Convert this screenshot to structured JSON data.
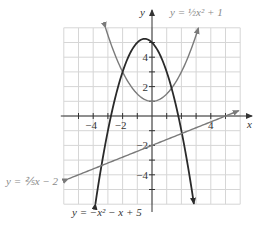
{
  "chart_data": {
    "type": "line",
    "title": "",
    "xlabel": "x",
    "ylabel": "y",
    "xlim": [
      -6,
      6
    ],
    "ylim": [
      -6,
      6
    ],
    "grid": true,
    "x_ticks": [
      -4,
      -2,
      4
    ],
    "y_ticks": [
      4,
      2,
      -2,
      -4
    ],
    "series": [
      {
        "name": "y = ½x² + 1",
        "expr": "0.5*x^2+1",
        "color": "#7a7a7a",
        "domain": [
          -3.16,
          3.16
        ]
      },
      {
        "name": "y = −x² − x + 5",
        "expr": "-x^2-x+5",
        "color": "#2a2a2a",
        "domain": [
          -3.85,
          2.85
        ]
      },
      {
        "name": "y = ⅖x − 2",
        "expr": "0.4*x-2",
        "color": "#7a7a7a",
        "domain": [
          -5.7,
          5.9
        ]
      }
    ]
  },
  "labels": {
    "x_axis": "x",
    "y_axis": "y",
    "curve_upper": "y = ½x² + 1",
    "curve_line": "y = ⅖x − 2",
    "curve_down": "y = −x² − x + 5"
  },
  "colors": {
    "grid": "#d6d6d6",
    "axis": "#333333",
    "gray_curve": "#7a7a7a",
    "dark_curve": "#2a2a2a",
    "label_gray": "#8a8a8a"
  }
}
